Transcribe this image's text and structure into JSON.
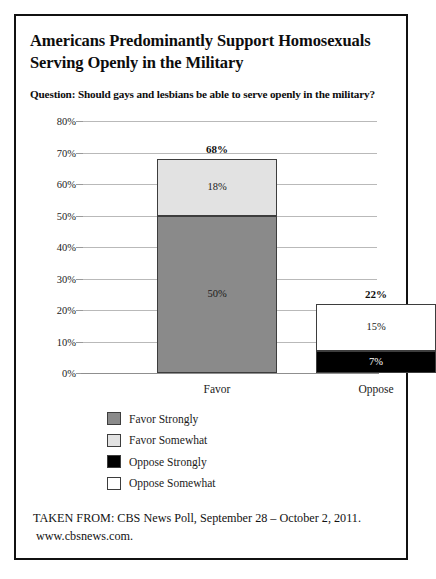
{
  "header": {
    "title_line1": "Americans Predominantly Support Homosexuals",
    "title_line2": "Serving Openly in the Military",
    "question": "Question: Should gays and lesbians be able to serve openly in the military?"
  },
  "source": {
    "line1": "TAKEN FROM: CBS News Poll, September 28 – October 2, 2011.",
    "line2": "www.cbsnews.com."
  },
  "colors": {
    "favor_strongly": "#8a8a8a",
    "favor_somewhat": "#e2e2e2",
    "oppose_strongly": "#000000",
    "oppose_somewhat": "#ffffff",
    "border": "#3d3d3d",
    "gridline": "#b9b9b9",
    "frame": "#111111"
  },
  "chart_data": {
    "type": "bar",
    "stacked": true,
    "title": "Americans Predominantly Support Homosexuals Serving Openly in the Military",
    "subtitle": "Question: Should gays and lesbians be able to serve openly in the military?",
    "xlabel": "",
    "ylabel": "",
    "ylim": [
      0,
      80
    ],
    "ytick_labels": [
      "0%",
      "10%",
      "20%",
      "30%",
      "40%",
      "50%",
      "60%",
      "70%",
      "80%"
    ],
    "ytick_values": [
      0,
      10,
      20,
      30,
      40,
      50,
      60,
      70,
      80
    ],
    "grid": true,
    "legend_position": "below-left",
    "categories": [
      "Favor",
      "Oppose"
    ],
    "series": [
      {
        "name": "Favor Strongly",
        "values": [
          50,
          0
        ],
        "color": "#8a8a8a",
        "label_color": "#1a1a1a"
      },
      {
        "name": "Favor Somewhat",
        "values": [
          18,
          0
        ],
        "color": "#e2e2e2",
        "label_color": "#1a1a1a"
      },
      {
        "name": "Oppose Strongly",
        "values": [
          0,
          7
        ],
        "color": "#000000",
        "label_color": "#ffffff"
      },
      {
        "name": "Oppose Somewhat",
        "values": [
          0,
          15
        ],
        "color": "#ffffff",
        "label_color": "#1a1a1a"
      }
    ],
    "totals": [
      68,
      22
    ],
    "total_labels": [
      "68%",
      "22%"
    ],
    "segment_labels": {
      "favor": [
        "50%",
        "18%"
      ],
      "oppose": [
        "7%",
        "15%"
      ]
    }
  },
  "legend": {
    "items": [
      {
        "label": "Favor Strongly",
        "color": "#8a8a8a"
      },
      {
        "label": "Favor Somewhat",
        "color": "#e2e2e2"
      },
      {
        "label": "Oppose Strongly",
        "color": "#000000"
      },
      {
        "label": "Oppose Somewhat",
        "color": "#ffffff"
      }
    ]
  }
}
